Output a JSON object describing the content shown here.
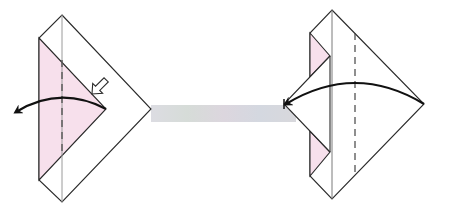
{
  "diagram": {
    "title": "Origami folding steps",
    "width": 449,
    "height": 215,
    "background": "#ffffff",
    "colors": {
      "line": "#2a2a2a",
      "center_line": "#9a9a9a",
      "paper_back": "#f7e0ec",
      "paper_front": "#ffffff",
      "arrow": "#111111",
      "strip": "#d8d8de"
    },
    "steps": [
      {
        "id": "step-left",
        "description": "Diamond with pink triangular flap on left; valley fold along dashed line; curved arrow folds flap to the left; hollow push arrow points at the flap edge.",
        "outline": [
          [
            62,
            15
          ],
          [
            151,
            109
          ],
          [
            62,
            202
          ],
          [
            39,
            180
          ],
          [
            39,
            38
          ]
        ],
        "center_line": {
          "x": 62,
          "y1": 15,
          "y2": 202
        },
        "pink_flap": [
          [
            39,
            38
          ],
          [
            106,
            109
          ],
          [
            39,
            180
          ]
        ],
        "dashed_fold": {
          "x": 62,
          "y1": 60,
          "y2": 156
        },
        "curve_arrow": {
          "from": [
            106,
            109
          ],
          "to": [
            16,
            112
          ],
          "ctrl": [
            60,
            85
          ]
        },
        "push_arrow": {
          "tip": [
            92,
            94
          ],
          "angle": -45
        }
      },
      {
        "id": "step-right",
        "description": "Result diamond with small pink triangles at left edge; valley fold along dashed line; curved arrow folds right point to left point.",
        "outline": [
          [
            332,
            10
          ],
          [
            424,
            104
          ],
          [
            332,
            199
          ],
          [
            310,
            176
          ],
          [
            310,
            33
          ]
        ],
        "center_line": {
          "x": 332,
          "y1": 10,
          "y2": 199
        },
        "flap_edge_line": {
          "x": 330,
          "y1": 56,
          "y2": 152
        },
        "pink_triangles": [
          [
            [
              310,
              33
            ],
            [
              330,
              56
            ],
            [
              310,
              77
            ]
          ],
          [
            [
              310,
              131
            ],
            [
              330,
              152
            ],
            [
              310,
              176
            ]
          ]
        ],
        "inner_edges": [
          [
            [
              330,
              56
            ],
            [
              284,
              104
            ]
          ],
          [
            [
              284,
              104
            ],
            [
              330,
              152
            ]
          ]
        ],
        "dashed_fold": {
          "x": 355,
          "y1": 33,
          "y2": 175
        },
        "curve_arrow": {
          "from": [
            424,
            104
          ],
          "to": [
            286,
            104
          ],
          "ctrl": [
            355,
            62
          ]
        }
      }
    ],
    "connector_strip": {
      "x": 151,
      "y": 105,
      "width": 145,
      "height": 17
    }
  }
}
